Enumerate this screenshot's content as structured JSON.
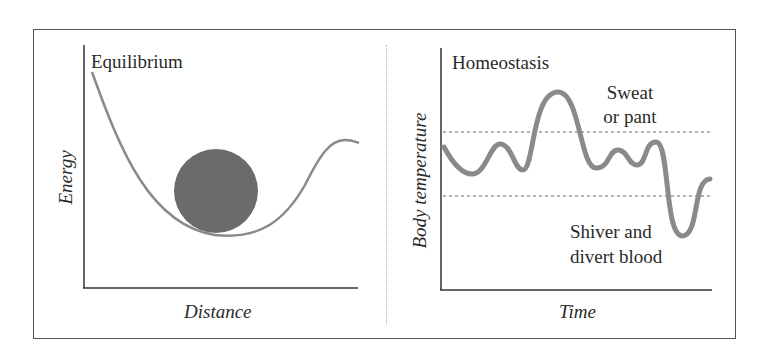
{
  "left_panel": {
    "title": "Equilibrium",
    "y_axis_label": "Energy",
    "x_axis_label": "Distance",
    "description": "Potential energy well with a ball resting at the minimum"
  },
  "right_panel": {
    "title": "Homeostasis",
    "y_axis_label": "Body temperature",
    "x_axis_label": "Time",
    "upper_annotation_line1": "Sweat",
    "upper_annotation_line2": "or pant",
    "lower_annotation_line1": "Shiver and",
    "lower_annotation_line2": "divert blood",
    "description": "Body temperature oscillates between upper and lower dotted thresholds"
  },
  "colors": {
    "curve": "#8a8a8a",
    "ball": "#6b6b6b",
    "axes": "#333333",
    "threshold_lines": "#666666",
    "frame": "#555555"
  }
}
